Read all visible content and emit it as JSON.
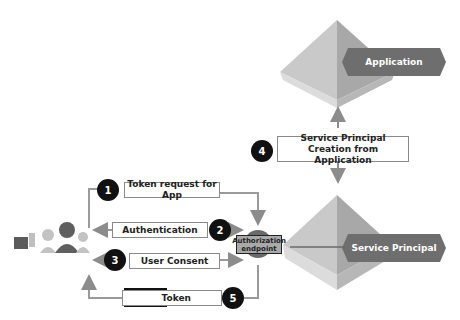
{
  "diagram": {
    "nodes": {
      "application": {
        "label": "Application"
      },
      "service_principal": {
        "label": "Service Principal"
      },
      "authorization_endpoint": {
        "label": "Authorization endpoint"
      },
      "users": {
        "label": ""
      }
    },
    "steps": [
      {
        "number": "1",
        "label": "Token request for App"
      },
      {
        "number": "2",
        "label": "Authentication"
      },
      {
        "number": "3",
        "label": "User Consent"
      },
      {
        "number": "4",
        "label": "Service Principal Creation from Application"
      },
      {
        "number": "5",
        "label": "Token"
      }
    ],
    "colors": {
      "pyramid_light": "#d4d4d4",
      "pyramid_dark": "#a3a3a3",
      "tag_fill": "#6e6e6e",
      "arrow": "#8c8c8c",
      "badge": "#111111"
    }
  }
}
